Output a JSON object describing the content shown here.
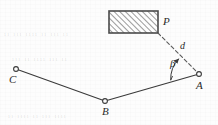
{
  "figure": {
    "background_color": "#fdfdfd",
    "stroke_color": "#3a3a3a",
    "hatch_color": "#777777",
    "width": 218,
    "height": 125
  },
  "labels": {
    "P": "P",
    "d": "d",
    "beta": "β",
    "A": "A",
    "B": "B",
    "C": "C"
  },
  "points": {
    "A": {
      "label": "A",
      "x": 199,
      "y": 74
    },
    "B": {
      "label": "B",
      "x": 105,
      "y": 101
    },
    "C": {
      "label": "C",
      "x": 16,
      "y": 69
    },
    "P": {
      "label": "P",
      "x": 158,
      "y": 33
    }
  },
  "segments": [
    {
      "name": "C-B",
      "from": "C",
      "to": "B",
      "style": "solid"
    },
    {
      "name": "B-A",
      "from": "B",
      "to": "A",
      "style": "solid"
    },
    {
      "name": "A-P",
      "from": "A",
      "to": "P",
      "style": "dashed",
      "measure_label": "d"
    }
  ],
  "angle": {
    "name": "beta",
    "symbol": "β",
    "vertex": "A",
    "from_ray": "A-B",
    "to_ray": "A-P",
    "arrow": true
  },
  "rectangle": {
    "name": "hatched-region",
    "x": 109,
    "y": 11,
    "width": 49,
    "height": 22,
    "fill": "hatched",
    "hatch_angle_deg": 45
  },
  "scan_artifacts": {
    "bleed_line_1": "ıı ııı ıııı ıı ııı ıı",
    "bleed_line_2": "ııı ıı ıııı ııı ıı",
    "bleed_line_3": "ıı ıııı ıı ııı ıııı"
  }
}
